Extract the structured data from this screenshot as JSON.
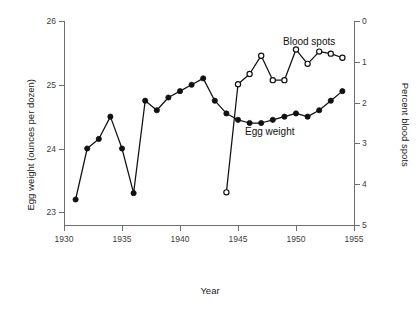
{
  "chart_data": {
    "type": "line",
    "title": "",
    "xlabel": "Year",
    "ylabel": "Egg weight (ounces per dozen)",
    "y2label": "Percent blood spots",
    "grid": false,
    "legend": "inline-annotation",
    "xlim": [
      1930,
      1955
    ],
    "xticks": [
      1930,
      1935,
      1940,
      1945,
      1950,
      1955
    ],
    "ylim": [
      22.8,
      26.0
    ],
    "yticks": [
      23,
      24,
      25,
      26
    ],
    "y2lim": [
      5,
      0
    ],
    "y2ticks": [
      0,
      1,
      2,
      3,
      4,
      5
    ],
    "y2_inverted": true,
    "series": [
      {
        "name": "Egg weight",
        "axis": "left",
        "marker": "filled-circle",
        "units": "ounces per dozen",
        "x": [
          1931,
          1932,
          1933,
          1934,
          1935,
          1936,
          1937,
          1938,
          1939,
          1940,
          1941,
          1942,
          1943,
          1944,
          1945,
          1946,
          1947,
          1948,
          1949,
          1950,
          1951,
          1952,
          1953,
          1954
        ],
        "values": [
          23.2,
          24.0,
          24.15,
          24.5,
          24.0,
          23.3,
          24.75,
          24.6,
          24.8,
          24.9,
          25.0,
          25.1,
          24.75,
          24.55,
          24.45,
          24.4,
          24.4,
          24.45,
          24.5,
          24.55,
          24.5,
          24.6,
          24.75,
          24.9
        ]
      },
      {
        "name": "Blood spots",
        "axis": "right",
        "marker": "open-circle",
        "units": "percent",
        "x": [
          1944,
          1945,
          1946,
          1947,
          1948,
          1949,
          1950,
          1951,
          1952,
          1953,
          1954
        ],
        "values": [
          4.2,
          1.55,
          1.3,
          0.85,
          1.45,
          1.45,
          0.7,
          1.05,
          0.75,
          0.8,
          0.9
        ]
      }
    ],
    "xtick_labels": [
      "1930",
      "1935",
      "1940",
      "1945",
      "1950",
      "1955"
    ],
    "ytick_labels": [
      "23",
      "24",
      "25",
      "26"
    ],
    "y2tick_labels": [
      "0",
      "1",
      "2",
      "3",
      "4",
      "5"
    ],
    "annotations": [
      {
        "text": "Blood spots",
        "series": "Blood spots"
      },
      {
        "text": "Egg weight",
        "series": "Egg weight"
      }
    ]
  },
  "axes": {
    "x_title": "Year",
    "y_left_title": "Egg weight (ounces per dozen)",
    "y_right_title": "Percent blood spots"
  },
  "labels": {
    "blood_spots": "Blood spots",
    "egg_weight": "Egg weight"
  },
  "colors": {
    "ink": "#111111",
    "axis": "#6e6e6e",
    "background": "#ffffff"
  }
}
